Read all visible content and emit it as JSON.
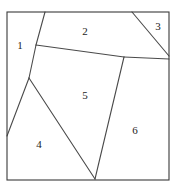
{
  "figure": {
    "background_color": "#ffffff",
    "line_color": "#4a4a4a",
    "frame_color": "#3a3a3a",
    "label_color": "#1c1c1c",
    "frame": {
      "x": 7,
      "y": 12,
      "width": 162,
      "height": 168
    },
    "regions": [
      {
        "id": "region-1",
        "label": "1",
        "label_x": 20,
        "label_y": 46,
        "polygon": "7,12 45,12 36,45 29,78 7,136"
      },
      {
        "id": "region-2",
        "label": "2",
        "label_x": 85,
        "label_y": 32,
        "polygon": "45,12 132,12 169,56 169,59 124,57 36,45"
      },
      {
        "id": "region-3",
        "label": "3",
        "label_x": 158,
        "label_y": 27,
        "polygon": "132,12 169,12 169,56"
      },
      {
        "id": "region-4",
        "label": "4",
        "label_x": 39,
        "label_y": 145,
        "polygon": "29,78 95,179 7,179 7,136"
      },
      {
        "id": "region-5",
        "label": "5",
        "label_x": 85,
        "label_y": 96,
        "polygon": "36,45 124,57 95,179 29,78"
      },
      {
        "id": "region-6",
        "label": "6",
        "label_x": 135,
        "label_y": 131,
        "polygon": "124,57 169,59 169,179 95,179"
      }
    ],
    "partition_lines": [
      {
        "id": "line-top-to-j1",
        "x1": 45,
        "y1": 12,
        "x2": 36,
        "y2": 45
      },
      {
        "id": "line-j1-to-j2",
        "x1": 36,
        "y1": 45,
        "x2": 29,
        "y2": 78
      },
      {
        "id": "line-j1-to-tjunction",
        "x1": 36,
        "y1": 45,
        "x2": 124,
        "y2": 57
      },
      {
        "id": "line-tjunction-right",
        "x1": 124,
        "y1": 57,
        "x2": 169,
        "y2": 59
      },
      {
        "id": "line-j2-to-left",
        "x1": 29,
        "y1": 78,
        "x2": 7,
        "y2": 136
      },
      {
        "id": "line-j2-to-bottom",
        "x1": 29,
        "y1": 78,
        "x2": 95,
        "y2": 179
      },
      {
        "id": "line-tjunction-down",
        "x1": 124,
        "y1": 57,
        "x2": 95,
        "y2": 179
      },
      {
        "id": "line-corner-diagonal",
        "x1": 132,
        "y1": 12,
        "x2": 169,
        "y2": 56
      }
    ]
  }
}
